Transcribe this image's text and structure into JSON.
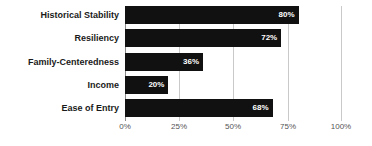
{
  "chart_data": {
    "type": "bar",
    "orientation": "horizontal",
    "title": "",
    "xlabel": "",
    "ylabel": "",
    "xlim": [
      0,
      100
    ],
    "grid": true,
    "legend": false,
    "xticks": [
      "0%",
      "25%",
      "50%",
      "75%",
      "100%"
    ],
    "xtick_values": [
      0,
      25,
      50,
      75,
      100
    ],
    "categories": [
      "Historical Stability",
      "Resiliency",
      "Family-Centeredness",
      "Income",
      "Ease of Entry"
    ],
    "values": [
      80,
      72,
      36,
      20,
      68
    ],
    "value_labels": [
      "80%",
      "72%",
      "36%",
      "20%",
      "68%"
    ],
    "bar_color": "#111111",
    "value_label_color": "#ffffff",
    "grid_color": "#c9c9c9",
    "axis_color": "#8a8a8a",
    "background_color": "#ffffff"
  }
}
